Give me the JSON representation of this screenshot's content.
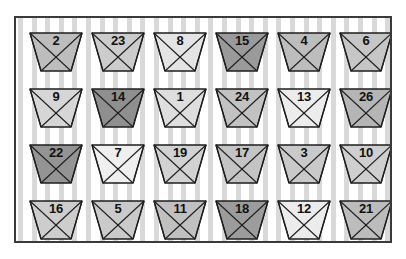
{
  "scene": {
    "title": "Grid of numbered trapezoid tokens on striped wallpaper",
    "background_color": "#ffffff",
    "frame_border_color": "#3a3a3a",
    "stripe_color": "#d9d9d9",
    "stripe_period_px": 13.6,
    "stripe_width_px": 5,
    "rows": 4,
    "columns": 6
  },
  "palette": {
    "very_light": "#efefef",
    "light": "#dedede",
    "mid_light": "#cccccc",
    "mid": "#bdbdbd",
    "mid_dark": "#a8a8a8",
    "dark": "#8f8f8f",
    "outline": "#1e1e1e",
    "label_color": "#111111"
  },
  "tokens": [
    {
      "label": "2",
      "row": 1,
      "col": 1,
      "fill": "#bdbdbd"
    },
    {
      "label": "23",
      "row": 1,
      "col": 2,
      "fill": "#cccccc"
    },
    {
      "label": "8",
      "row": 1,
      "col": 3,
      "fill": "#e4e4e4"
    },
    {
      "label": "15",
      "row": 1,
      "col": 4,
      "fill": "#9a9a9a"
    },
    {
      "label": "4",
      "row": 1,
      "col": 5,
      "fill": "#bdbdbd"
    },
    {
      "label": "6",
      "row": 1,
      "col": 6,
      "fill": "#c6c6c6"
    },
    {
      "label": "9",
      "row": 2,
      "col": 1,
      "fill": "#d6d6d6"
    },
    {
      "label": "14",
      "row": 2,
      "col": 2,
      "fill": "#8f8f8f"
    },
    {
      "label": "1",
      "row": 2,
      "col": 3,
      "fill": "#dedede"
    },
    {
      "label": "24",
      "row": 2,
      "col": 4,
      "fill": "#c2c2c2"
    },
    {
      "label": "13",
      "row": 2,
      "col": 5,
      "fill": "#ececec"
    },
    {
      "label": "26",
      "row": 2,
      "col": 6,
      "fill": "#b5b5b5"
    },
    {
      "label": "22",
      "row": 3,
      "col": 1,
      "fill": "#949494"
    },
    {
      "label": "7",
      "row": 3,
      "col": 2,
      "fill": "#efefef"
    },
    {
      "label": "19",
      "row": 3,
      "col": 3,
      "fill": "#d2d2d2"
    },
    {
      "label": "17",
      "row": 3,
      "col": 4,
      "fill": "#c4c4c4"
    },
    {
      "label": "3",
      "row": 3,
      "col": 5,
      "fill": "#c9c9c9"
    },
    {
      "label": "10",
      "row": 3,
      "col": 6,
      "fill": "#cfcfcf"
    },
    {
      "label": "16",
      "row": 4,
      "col": 1,
      "fill": "#cdcdcd"
    },
    {
      "label": "5",
      "row": 4,
      "col": 2,
      "fill": "#cacaca"
    },
    {
      "label": "11",
      "row": 4,
      "col": 3,
      "fill": "#c0c0c0"
    },
    {
      "label": "18",
      "row": 4,
      "col": 4,
      "fill": "#9c9c9c"
    },
    {
      "label": "12",
      "row": 4,
      "col": 5,
      "fill": "#ececec"
    },
    {
      "label": "21",
      "row": 4,
      "col": 6,
      "fill": "#bcbcbc"
    }
  ]
}
